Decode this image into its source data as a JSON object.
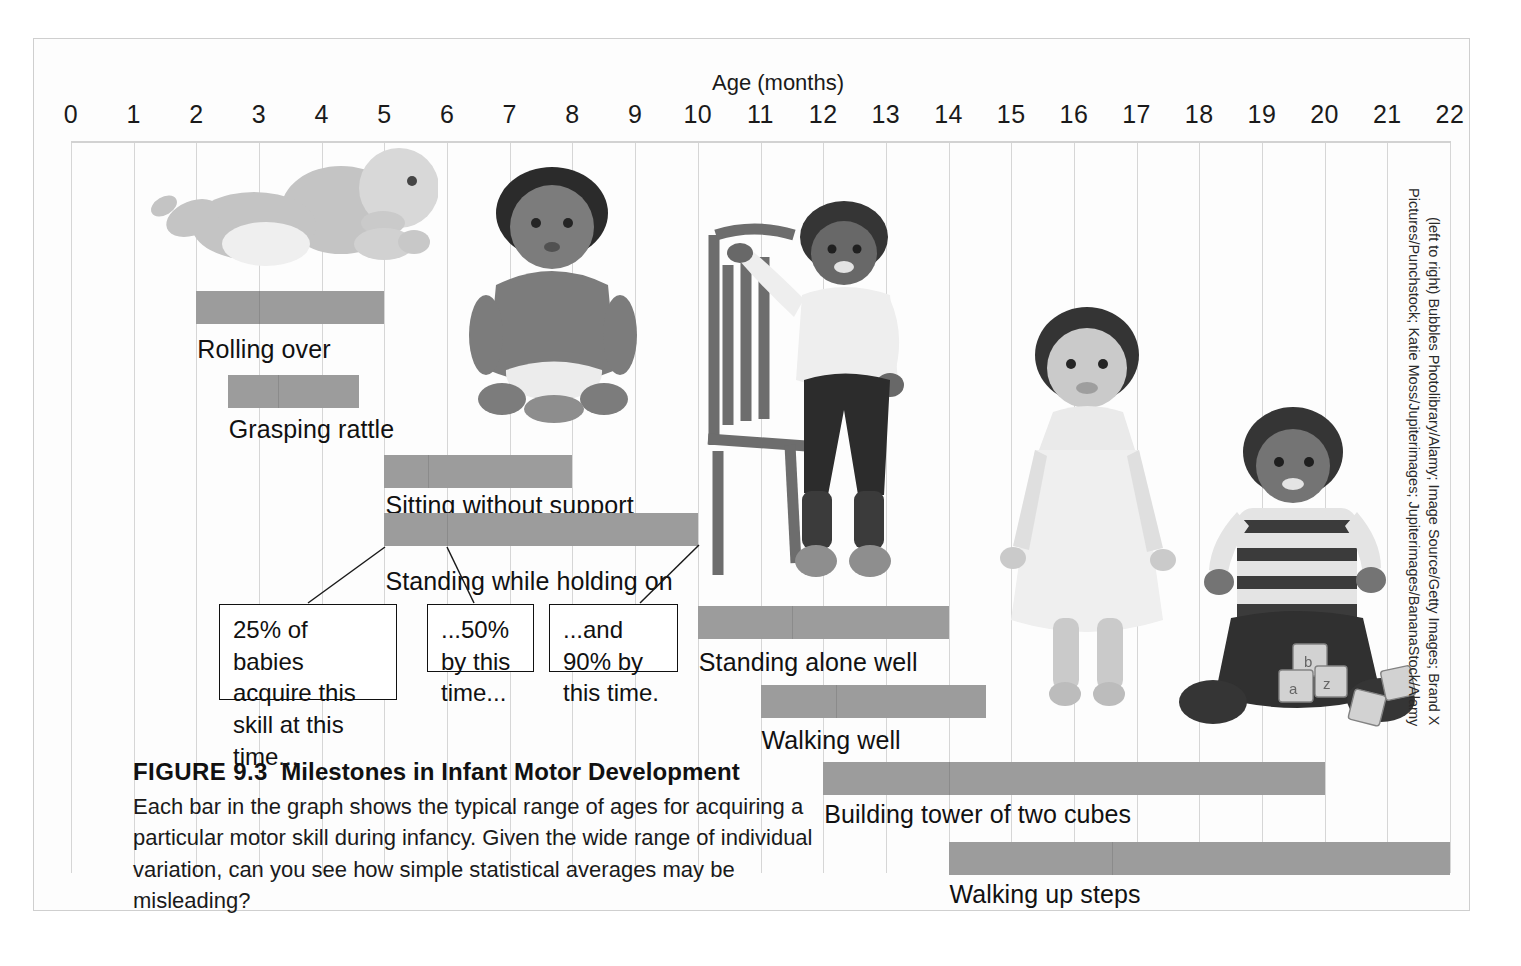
{
  "figure": {
    "axis_title": "Age (months)",
    "caption_number": "FIGURE 9.3",
    "caption_title": "Milestones in Infant Motor Development",
    "caption_body": "Each bar in the graph shows the typical range of ages for acquiring a particular motor skill during infancy. Given the wide range of individual variation, can you see how simple statistical averages may be misleading?",
    "photo_credit": "(left to right) Bubbles Photolibrary/Alamy; Image Source/Getty Images; Brand X Pictures/Punchstock; Katie Moss/Jupiterimages; Jupiterimages/BananaStock/Alamy",
    "bar_color": "#9c9c9c",
    "gridline_color": "#d6d6d6",
    "frame_border_color": "#cfcfcf"
  },
  "axis": {
    "ticks": [
      "0",
      "1",
      "2",
      "3",
      "4",
      "5",
      "6",
      "7",
      "8",
      "9",
      "10",
      "11",
      "12",
      "13",
      "14",
      "15",
      "16",
      "17",
      "18",
      "19",
      "20",
      "21",
      "22"
    ],
    "min": 0,
    "max": 22,
    "unit": "months"
  },
  "callouts": [
    {
      "id": "callout-25",
      "text": "25% of babies acquire this skill at this time..."
    },
    {
      "id": "callout-50",
      "text": "...50% by this time..."
    },
    {
      "id": "callout-90",
      "text": "...and 90% by this time."
    }
  ],
  "chart_data": {
    "type": "bar",
    "orientation": "horizontal-range",
    "title": "Milestones in Infant Motor Development",
    "xlabel": "Age (months)",
    "ylabel": "",
    "xlim": [
      0,
      22
    ],
    "grid": true,
    "legend": "none",
    "value_unit": "months",
    "categories": [
      "Rolling over",
      "Grasping rattle",
      "Sitting without support",
      "Standing while holding on",
      "Standing alone well",
      "Walking well",
      "Building tower of two cubes",
      "Walking up steps"
    ],
    "bars": [
      {
        "label": "Rolling over",
        "start": 2.0,
        "end": 5.0,
        "median": 3.0
      },
      {
        "label": "Grasping rattle",
        "start": 2.5,
        "end": 4.6,
        "median": 3.3
      },
      {
        "label": "Sitting without support",
        "start": 5.0,
        "end": 8.0,
        "median": 5.7
      },
      {
        "label": "Standing while holding on",
        "start": 5.0,
        "end": 10.0,
        "median": 6.0
      },
      {
        "label": "Standing alone well",
        "start": 10.0,
        "end": 14.0,
        "median": 11.5
      },
      {
        "label": "Walking well",
        "start": 11.0,
        "end": 14.6,
        "median": 12.2
      },
      {
        "label": "Building tower of two cubes",
        "start": 12.0,
        "end": 20.0,
        "median": 14.0
      },
      {
        "label": "Walking up steps",
        "start": 14.0,
        "end": 22.0,
        "median": 16.6
      }
    ],
    "annotations": [
      "25% of babies acquire this skill at this time...",
      "...50% by this time...",
      "...and 90% by this time."
    ]
  }
}
